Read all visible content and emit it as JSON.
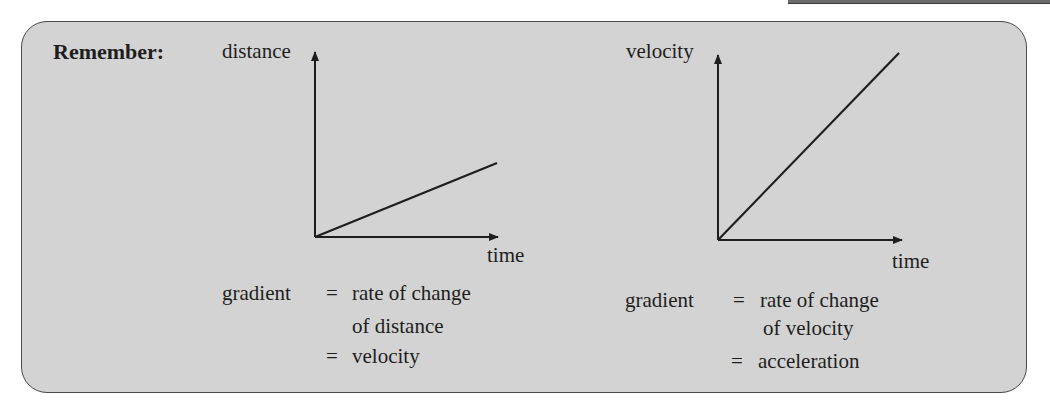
{
  "title": "Remember:",
  "colors": {
    "box_bg": "#d3d3d3",
    "box_border": "#4a4a4a",
    "ink": "#1e1e1e"
  },
  "graphs": [
    {
      "y_label": "distance",
      "x_label": "time",
      "line": "shallow straight line from origin",
      "caption": {
        "lhs": "gradient",
        "eq": "=",
        "line1": "rate of change",
        "line2": "of distance",
        "line3_eq": "=",
        "line3": "velocity"
      }
    },
    {
      "y_label": "velocity",
      "x_label": "time",
      "line": "steep straight line from origin",
      "caption": {
        "lhs": "gradient",
        "eq": "=",
        "line1": "rate of change",
        "line2": "of velocity",
        "line3_eq": "=",
        "line3": "acceleration"
      }
    }
  ],
  "icons": [
    "arrow-up-icon",
    "arrow-right-icon"
  ]
}
